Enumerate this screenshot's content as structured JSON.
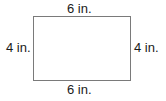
{
  "diagram": {
    "shape": "rectangle",
    "labels": {
      "top": "6 in.",
      "bottom": "6 in.",
      "left": "4 in.",
      "right": "4 in."
    },
    "stroke_color": "#7a7a7a"
  }
}
